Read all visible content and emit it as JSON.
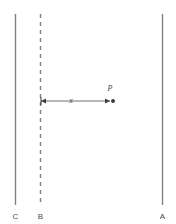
{
  "figure": {
    "background_color": "#ffffff",
    "line_color": "#808080",
    "dim_line_color": "#6e6e6e",
    "text_color": "#4a4a4a",
    "width": 176,
    "height": 224,
    "lines": [
      {
        "id": "line-c",
        "label": "C",
        "style": "solid",
        "x": 15.5,
        "y_top": 14,
        "y_bottom": 205,
        "label_x": 15.5,
        "label_y": 219
      },
      {
        "id": "line-b",
        "label": "B",
        "style": "dashed",
        "x": 40.5,
        "y_top": 14,
        "y_bottom": 205,
        "label_x": 40.5,
        "label_y": 219
      },
      {
        "id": "line-a",
        "label": "A",
        "style": "solid",
        "x": 162.5,
        "y_top": 14,
        "y_bottom": 205,
        "label_x": 162.5,
        "label_y": 219
      }
    ],
    "dimension": {
      "label": "x",
      "label_x": 71,
      "label_y": 103,
      "y": 101,
      "x_start": 41,
      "x_end": 110,
      "arrow_size": 4
    },
    "point": {
      "label": "P",
      "x": 113,
      "y": 101,
      "radius": 2,
      "label_x": 110,
      "label_y": 91
    }
  }
}
